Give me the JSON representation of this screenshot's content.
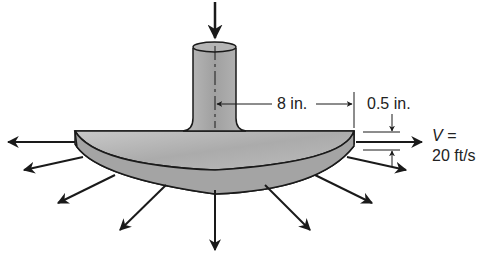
{
  "figure": {
    "type": "fluid-mechanics-diagram",
    "labels": {
      "radius": "8 in.",
      "gap": "0.5 in.",
      "velocity_symbol": "V",
      "velocity_eq": "=",
      "velocity_value": "20 ft/s"
    },
    "colors": {
      "metal_light": "#d0d0d0",
      "metal_mid": "#a8a8a8",
      "metal_dark": "#8a8a8a",
      "line": "#1a1a1a"
    }
  }
}
